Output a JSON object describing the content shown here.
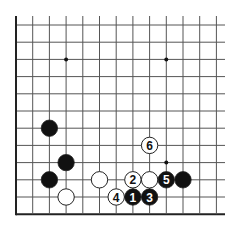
{
  "board": {
    "title": "Go board diagram",
    "origin_x": 16,
    "origin_y": 25,
    "spacing_x": 16.7,
    "spacing_y": 17.2,
    "cols": 13,
    "rows": 12,
    "right_extend": 225,
    "top_extend": 16,
    "line_color": "#555555",
    "edge_color": "#222222",
    "stone_radius": 8.2
  },
  "star_points": [
    {
      "col": 3,
      "row": 2
    },
    {
      "col": 9,
      "row": 2
    },
    {
      "col": 9,
      "row": 8
    }
  ],
  "stones": [
    {
      "color": "black",
      "col": 2,
      "row": 6,
      "label": ""
    },
    {
      "color": "black",
      "col": 3,
      "row": 8,
      "label": ""
    },
    {
      "color": "black",
      "col": 2,
      "row": 9,
      "label": ""
    },
    {
      "color": "white",
      "col": 3,
      "row": 10,
      "label": ""
    },
    {
      "color": "white",
      "col": 5,
      "row": 9,
      "label": ""
    },
    {
      "color": "white",
      "col": 7,
      "row": 9,
      "label": "2"
    },
    {
      "color": "white",
      "col": 8,
      "row": 9,
      "label": ""
    },
    {
      "color": "black",
      "col": 9,
      "row": 9,
      "label": "5"
    },
    {
      "color": "black",
      "col": 10,
      "row": 9,
      "label": ""
    },
    {
      "color": "white",
      "col": 8,
      "row": 7,
      "label": "6"
    },
    {
      "color": "white",
      "col": 6,
      "row": 10,
      "label": "4"
    },
    {
      "color": "black",
      "col": 7,
      "row": 10,
      "label": "1"
    },
    {
      "color": "black",
      "col": 8,
      "row": 10,
      "label": "3"
    }
  ]
}
